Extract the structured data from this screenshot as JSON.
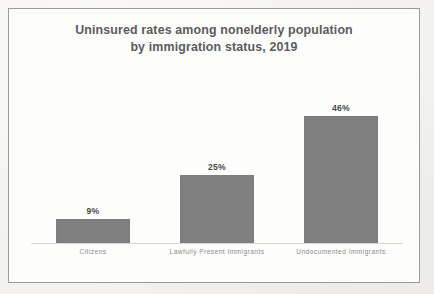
{
  "figure": {
    "background_color": "#f3f2f0",
    "panel_color": "#fdfdfc",
    "border_color": "#9a9a9a"
  },
  "chart_data": {
    "type": "bar",
    "title": "Uninsured rates among nonelderly population by immigration status, 2019",
    "title_lines": [
      "Uninsured rates among nonelderly population",
      "by immigration status, 2019"
    ],
    "categories": [
      "Citizens",
      "Lawfully Present Immigrants",
      "Undocumented Immigrants"
    ],
    "values": [
      9,
      25,
      46
    ],
    "value_labels": [
      "9%",
      "25%",
      "46%"
    ],
    "xlabel": "",
    "ylabel": "",
    "ylim": [
      0,
      68
    ],
    "grid": false,
    "legend": false,
    "series": [
      {
        "name": "Uninsured rate",
        "values": [
          9,
          25,
          46
        ],
        "color": "#808080"
      }
    ],
    "bar_color": "#808080",
    "title_color": "#5b5b5b",
    "value_label_color": "#4a4a4a",
    "tick_label_color": "#8b8b8b",
    "axis_line_color": "#d6d6d6"
  }
}
